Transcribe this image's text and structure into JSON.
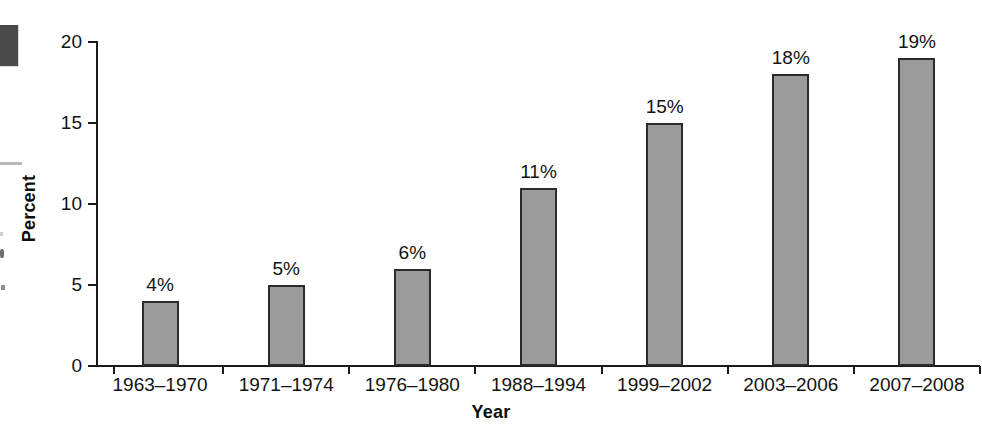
{
  "chart_data": {
    "type": "bar",
    "title": "",
    "subtitle": "",
    "xlabel": "Year",
    "ylabel": "Percent",
    "categories": [
      "1963–1970",
      "1971–1974",
      "1976–1980",
      "1988–1994",
      "1999–2002",
      "2003–2006",
      "2007–2008"
    ],
    "values": [
      4,
      5,
      6,
      11,
      15,
      18,
      19
    ],
    "value_labels": [
      "4%",
      "5%",
      "6%",
      "11%",
      "15%",
      "18%",
      "19%"
    ],
    "ylim": [
      0,
      20
    ],
    "ytick_labels": [
      "0",
      "5",
      "10",
      "15",
      "20"
    ],
    "ytick_values": [
      0,
      5,
      10,
      15,
      20
    ],
    "grid": false,
    "legend": null,
    "legend_position": "none",
    "bar_fill_color": "#9b9b9b",
    "bar_edge_color": "#2b2b2b",
    "axis_color": "#1b1b1b",
    "text_color": "#131313",
    "background_color": "#ffffff"
  }
}
